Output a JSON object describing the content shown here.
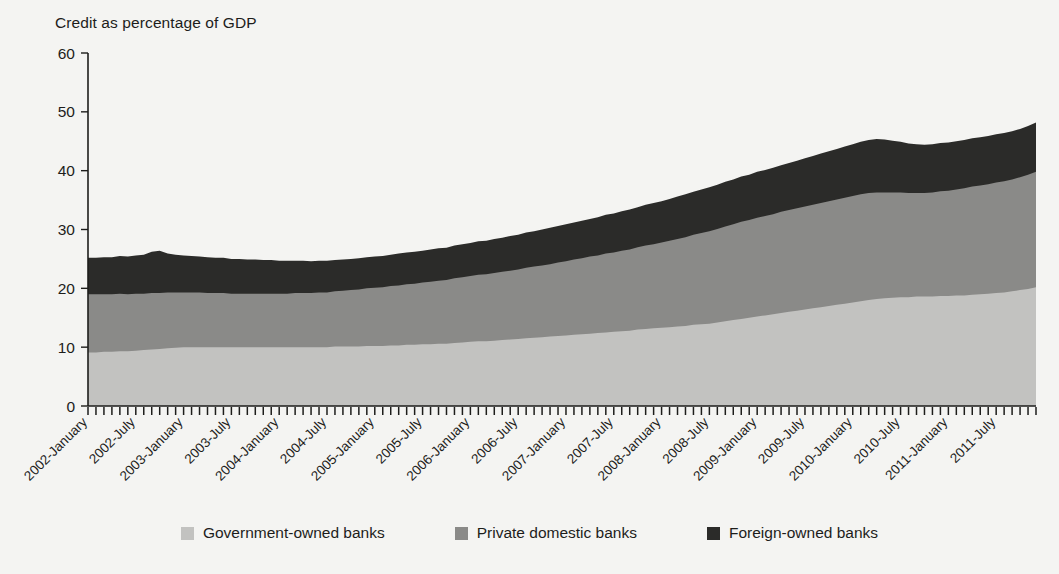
{
  "chart_data": {
    "type": "area",
    "stacked": true,
    "title": "Credit as percentage of GDP",
    "xlabel": "",
    "ylabel": "",
    "ylim": [
      0,
      60
    ],
    "yticks": [
      0,
      10,
      20,
      30,
      40,
      50,
      60
    ],
    "grid": false,
    "legend_position": "bottom",
    "xtick_labels": [
      "2002-January",
      "2002-July",
      "2003-January",
      "2003-July",
      "2004-January",
      "2004-July",
      "2005-January",
      "2005-July",
      "2006-January",
      "2006-July",
      "2007-January",
      "2007-July",
      "2008-January",
      "2008-July",
      "2009-January",
      "2009-July",
      "2010-January",
      "2010-July",
      "2011-January",
      "2011-July"
    ],
    "x_start": "2002-January",
    "x_end": "2011-December",
    "x_interval": "monthly",
    "series": [
      {
        "name": "Government-owned banks",
        "color": "#c2c2c0",
        "values": [
          9.1,
          9.1,
          9.2,
          9.2,
          9.3,
          9.3,
          9.4,
          9.5,
          9.6,
          9.7,
          9.8,
          9.9,
          10.0,
          10.0,
          10.0,
          10.0,
          10.0,
          10.0,
          10.0,
          10.0,
          10.0,
          10.0,
          10.0,
          10.0,
          10.0,
          10.0,
          10.0,
          10.0,
          10.0,
          10.0,
          10.0,
          10.1,
          10.1,
          10.1,
          10.1,
          10.2,
          10.2,
          10.2,
          10.3,
          10.3,
          10.4,
          10.4,
          10.5,
          10.5,
          10.6,
          10.6,
          10.7,
          10.8,
          10.9,
          11.0,
          11.0,
          11.1,
          11.2,
          11.3,
          11.4,
          11.5,
          11.6,
          11.7,
          11.8,
          11.9,
          12.0,
          12.1,
          12.2,
          12.3,
          12.4,
          12.5,
          12.6,
          12.7,
          12.8,
          13.0,
          13.1,
          13.2,
          13.3,
          13.4,
          13.5,
          13.6,
          13.8,
          13.9,
          14.0,
          14.2,
          14.4,
          14.6,
          14.8,
          15.0,
          15.2,
          15.4,
          15.6,
          15.8,
          16.0,
          16.2,
          16.4,
          16.6,
          16.8,
          17.0,
          17.2,
          17.4,
          17.6,
          17.8,
          18.0,
          18.2,
          18.3,
          18.4,
          18.5,
          18.5,
          18.6,
          18.6,
          18.6,
          18.7,
          18.7,
          18.8,
          18.8,
          18.9,
          19.0,
          19.1,
          19.2,
          19.3,
          19.5,
          19.7,
          19.9,
          20.2
        ]
      },
      {
        "name": "Private domestic banks",
        "color": "#8a8a88",
        "values": [
          9.9,
          9.9,
          9.8,
          9.8,
          9.8,
          9.7,
          9.7,
          9.6,
          9.6,
          9.5,
          9.5,
          9.4,
          9.3,
          9.3,
          9.3,
          9.2,
          9.2,
          9.2,
          9.1,
          9.1,
          9.1,
          9.1,
          9.1,
          9.1,
          9.1,
          9.1,
          9.2,
          9.2,
          9.2,
          9.3,
          9.3,
          9.4,
          9.5,
          9.6,
          9.7,
          9.8,
          9.9,
          10.0,
          10.1,
          10.2,
          10.3,
          10.4,
          10.5,
          10.6,
          10.7,
          10.8,
          11.0,
          11.1,
          11.2,
          11.3,
          11.4,
          11.5,
          11.6,
          11.7,
          11.8,
          12.0,
          12.1,
          12.2,
          12.3,
          12.5,
          12.6,
          12.8,
          12.9,
          13.1,
          13.2,
          13.4,
          13.5,
          13.7,
          13.8,
          14.0,
          14.2,
          14.3,
          14.5,
          14.7,
          14.9,
          15.1,
          15.3,
          15.5,
          15.7,
          15.9,
          16.1,
          16.3,
          16.5,
          16.6,
          16.8,
          16.9,
          17.0,
          17.2,
          17.3,
          17.4,
          17.5,
          17.6,
          17.7,
          17.8,
          17.9,
          18.0,
          18.1,
          18.2,
          18.2,
          18.1,
          18.0,
          17.9,
          17.8,
          17.7,
          17.6,
          17.6,
          17.7,
          17.8,
          17.9,
          18.0,
          18.2,
          18.4,
          18.5,
          18.6,
          18.8,
          18.9,
          19.0,
          19.2,
          19.4,
          19.6
        ]
      },
      {
        "name": "Foreign-owned banks",
        "color": "#2b2b29",
        "values": [
          6.2,
          6.2,
          6.3,
          6.3,
          6.4,
          6.4,
          6.5,
          6.6,
          7.0,
          7.2,
          6.6,
          6.4,
          6.3,
          6.2,
          6.1,
          6.1,
          6.0,
          6.0,
          5.9,
          5.9,
          5.8,
          5.8,
          5.7,
          5.7,
          5.6,
          5.6,
          5.5,
          5.5,
          5.4,
          5.4,
          5.4,
          5.3,
          5.3,
          5.3,
          5.3,
          5.3,
          5.3,
          5.3,
          5.3,
          5.4,
          5.4,
          5.4,
          5.4,
          5.5,
          5.5,
          5.5,
          5.6,
          5.6,
          5.6,
          5.7,
          5.7,
          5.8,
          5.8,
          5.9,
          5.9,
          6.0,
          6.0,
          6.1,
          6.2,
          6.2,
          6.3,
          6.3,
          6.4,
          6.4,
          6.5,
          6.6,
          6.6,
          6.7,
          6.8,
          6.8,
          6.9,
          7.0,
          7.0,
          7.1,
          7.2,
          7.3,
          7.3,
          7.4,
          7.5,
          7.5,
          7.6,
          7.6,
          7.7,
          7.7,
          7.8,
          7.8,
          7.9,
          7.9,
          8.0,
          8.1,
          8.2,
          8.3,
          8.4,
          8.5,
          8.6,
          8.7,
          8.8,
          8.9,
          9.0,
          9.1,
          9.0,
          8.8,
          8.6,
          8.4,
          8.3,
          8.2,
          8.2,
          8.2,
          8.2,
          8.2,
          8.2,
          8.2,
          8.2,
          8.2,
          8.2,
          8.2,
          8.2,
          8.2,
          8.3,
          8.4
        ]
      }
    ]
  },
  "legend": {
    "items": [
      {
        "label": "Government-owned banks",
        "color": "#c2c2c0"
      },
      {
        "label": "Private domestic banks",
        "color": "#8a8a88"
      },
      {
        "label": "Foreign-owned banks",
        "color": "#2b2b29"
      }
    ]
  },
  "colors": {
    "background": "#f4f4f2",
    "axis": "#1d1d1b",
    "text": "#1d1d1b"
  }
}
